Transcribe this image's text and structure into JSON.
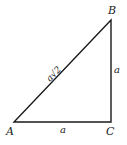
{
  "diagram": {
    "type": "right-triangle",
    "stroke_color": "#1a1a1a",
    "background": "#ffffff",
    "vertices": {
      "A": {
        "label": "A",
        "x": 14,
        "y": 122
      },
      "B": {
        "label": "B",
        "x": 111,
        "y": 20
      },
      "C": {
        "label": "C",
        "x": 111,
        "y": 122
      }
    },
    "sides": {
      "AC": {
        "label": "a"
      },
      "BC": {
        "label": "a"
      },
      "AB": {
        "label": "a√2"
      }
    }
  }
}
